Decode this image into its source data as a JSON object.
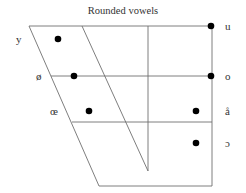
{
  "title": "Rounded vowels",
  "colors": {
    "line": "#6f6f6f",
    "dot": "#000000",
    "text": "#333333"
  },
  "vowels": [
    {
      "symbol": "y",
      "label_x": 16,
      "label_y": 43,
      "dot_x": 58,
      "dot_y": 39,
      "side": "front"
    },
    {
      "symbol": "ø",
      "label_x": 36,
      "label_y": 80,
      "dot_x": 74,
      "dot_y": 76,
      "side": "front"
    },
    {
      "symbol": "œ",
      "label_x": 50,
      "label_y": 115,
      "dot_x": 89,
      "dot_y": 111,
      "side": "front"
    },
    {
      "symbol": "u",
      "label_x": 225,
      "label_y": 30,
      "dot_x": 211,
      "dot_y": 26,
      "side": "back"
    },
    {
      "symbol": "o",
      "label_x": 225,
      "label_y": 80,
      "dot_x": 211,
      "dot_y": 76,
      "side": "back"
    },
    {
      "symbol": "å",
      "label_x": 225,
      "label_y": 115,
      "dot_x": 196,
      "dot_y": 111,
      "side": "back"
    },
    {
      "symbol": "ɔ",
      "label_x": 225,
      "label_y": 147,
      "dot_x": 196,
      "dot_y": 143,
      "side": "back"
    }
  ]
}
